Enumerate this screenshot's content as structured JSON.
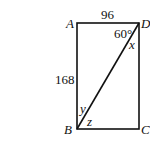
{
  "figure": {
    "type": "rectangle with diagonal",
    "vertices": {
      "A": "A",
      "B": "B",
      "C": "C",
      "D": "D"
    },
    "side_labels": {
      "AD": "96",
      "AB": "168"
    },
    "angle_labels": {
      "at_D_between_AD_and_DB": "60°",
      "x": "x",
      "y": "y",
      "z": "z"
    }
  }
}
